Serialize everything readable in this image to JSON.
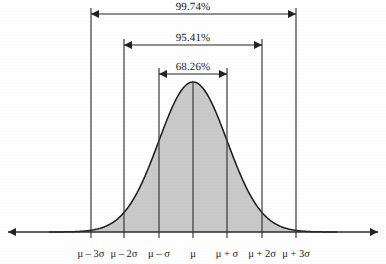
{
  "figure": {
    "background_color": "#fefefe",
    "curve_fill_color": "#c9c9c9",
    "curve_stroke_color": "#1a1a1a",
    "line_color": "#3a3a3a",
    "text_color": "#1b1b1b"
  },
  "chart_data": {
    "type": "area",
    "title": "",
    "subtitle": "",
    "xlabel": "",
    "ylabel": "",
    "grid": false,
    "legend": null,
    "distribution": "normal",
    "mean_label": "μ",
    "sigma_label": "σ",
    "xlim": [
      -4.2,
      4.2
    ],
    "ylim": [
      0,
      1.05
    ],
    "x_tick_positions_sigma": [
      -3,
      -2,
      -1,
      0,
      1,
      2,
      3
    ],
    "x_tick_labels": [
      "μ – 3σ",
      "μ – 2σ",
      "μ – σ",
      "μ",
      "μ + σ",
      "μ + 2σ",
      "μ + 3σ"
    ],
    "x_tick_pixels": [
      91,
      124,
      159,
      193,
      227,
      262,
      296
    ],
    "baseline_y_pixel": 232,
    "peak_y_pixel": 82,
    "center_x_pixel": 193,
    "intervals": [
      {
        "name": "three-sigma",
        "label": "99.74%",
        "value": 99.74,
        "sigma_range": [
          -3,
          3
        ],
        "from_tick": "μ – 3σ",
        "to_tick": "μ + 3σ",
        "arrow_y_pixel": 14,
        "x_start_pixel": 91,
        "x_end_pixel": 296,
        "label_x_pixel": 193,
        "label_y_pixel": 1
      },
      {
        "name": "two-sigma",
        "label": "95.41%",
        "value": 95.41,
        "sigma_range": [
          -2,
          2
        ],
        "from_tick": "μ – 2σ",
        "to_tick": "μ + 2σ",
        "arrow_y_pixel": 45,
        "x_start_pixel": 124,
        "x_end_pixel": 262,
        "label_x_pixel": 193,
        "label_y_pixel": 32
      },
      {
        "name": "one-sigma",
        "label": "68.26%",
        "value": 68.26,
        "sigma_range": [
          -1,
          1
        ],
        "from_tick": "μ – σ",
        "to_tick": "μ + σ",
        "arrow_y_pixel": 74,
        "x_start_pixel": 159,
        "x_end_pixel": 227,
        "label_x_pixel": 193,
        "label_y_pixel": 61
      }
    ],
    "vertical_lines": [
      {
        "name": "minus-3-sigma",
        "x_pixel": 91,
        "y_top_pixel": 8,
        "y_bottom_pixel": 238
      },
      {
        "name": "minus-2-sigma",
        "x_pixel": 124,
        "y_top_pixel": 39,
        "y_bottom_pixel": 238
      },
      {
        "name": "minus-1-sigma",
        "x_pixel": 159,
        "y_top_pixel": 68,
        "y_bottom_pixel": 238
      },
      {
        "name": "mean",
        "x_pixel": 193,
        "y_top_pixel": 82,
        "y_bottom_pixel": 238
      },
      {
        "name": "plus-1-sigma",
        "x_pixel": 227,
        "y_top_pixel": 68,
        "y_bottom_pixel": 238
      },
      {
        "name": "plus-2-sigma",
        "x_pixel": 262,
        "y_top_pixel": 39,
        "y_bottom_pixel": 238
      },
      {
        "name": "plus-3-sigma",
        "x_pixel": 296,
        "y_top_pixel": 8,
        "y_bottom_pixel": 238
      }
    ],
    "x_axis": {
      "y_pixel": 232,
      "x_start_pixel": 8,
      "x_end_pixel": 378,
      "arrow_left": true,
      "arrow_right": true
    },
    "axis_label_y_pixel": 248
  }
}
